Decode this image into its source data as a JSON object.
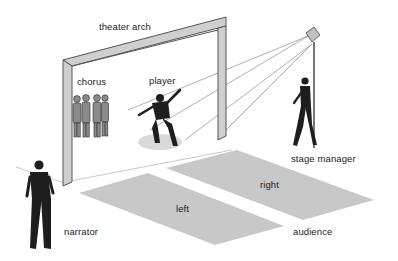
{
  "diagram": {
    "title": "",
    "labels": {
      "theater_arch": "theater arch",
      "chorus": "chorus",
      "player": "player",
      "stage_manager": "stage manager",
      "narrator": "narrator",
      "left": "left",
      "right": "right",
      "audience": "audience"
    },
    "colors": {
      "background": "#ffffff",
      "arch_fill": "#cfcfcf",
      "arch_edge": "#555555",
      "audience_area": "#c8c8c8",
      "figure": "#1e1e1e",
      "beam_line": "#999999",
      "spotlight": "#bdbdbd"
    },
    "elements": [
      "theater-arch",
      "chorus-group",
      "player-figure",
      "spotlight",
      "stage-manager-figure",
      "narrator-figure",
      "audience-left-area",
      "audience-right-area"
    ]
  }
}
